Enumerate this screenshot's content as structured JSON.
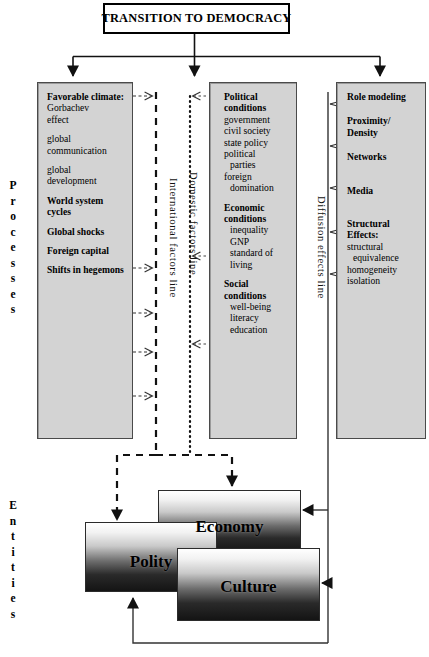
{
  "title": {
    "text": "TRANSITION TO DEMOCRACY"
  },
  "margin_labels": {
    "processes": "Processes",
    "entities": "Entities"
  },
  "axis_labels": {
    "international": "International factors line",
    "domestic": "Domestic factors line",
    "diffusion": "Diffusion effects line"
  },
  "columns": [
    {
      "name": "international-factors",
      "groups": [
        {
          "heading": "Favorable climate:",
          "items": [
            "Gorbachev",
            "effect"
          ]
        },
        {
          "heading": "",
          "items": [
            "global",
            "communication"
          ]
        },
        {
          "heading": "",
          "items": [
            "global",
            "development"
          ]
        },
        {
          "heading": "World system cycles",
          "items": []
        },
        {
          "heading": "Global shocks",
          "items": []
        },
        {
          "heading": "Foreign capital",
          "items": []
        },
        {
          "heading": "Shifts in hegemons",
          "items": []
        }
      ]
    },
    {
      "name": "domestic-factors",
      "groups": [
        {
          "heading": "Political conditions",
          "items": [
            "government",
            "civil society",
            "state policy",
            "political",
            "parties",
            "foreign",
            "domination"
          ]
        },
        {
          "heading": "Economic conditions",
          "items": [
            "inequality",
            "GNP",
            "standard of",
            "living"
          ]
        },
        {
          "heading": "Social conditions",
          "items": [
            "well-being",
            "literacy",
            "education"
          ]
        }
      ]
    },
    {
      "name": "diffusion-effects",
      "groups": [
        {
          "heading": "Role modeling",
          "items": []
        },
        {
          "heading": "Proximity/ Density",
          "items": []
        },
        {
          "heading": "Networks",
          "items": []
        },
        {
          "heading": "Media",
          "items": []
        },
        {
          "heading": "Structural Effects:",
          "items": [
            "structural",
            "equivalence",
            "homogeneity",
            "isolation"
          ]
        }
      ]
    }
  ],
  "entities": [
    {
      "name": "economy",
      "label": "Economy"
    },
    {
      "name": "polity",
      "label": "Polity"
    },
    {
      "name": "culture",
      "label": "Culture"
    }
  ],
  "colors": {
    "box_fill": "#d3d3d3",
    "box_border": "#4a4a4a",
    "line": "#1a1a1a",
    "title_border": "#000000"
  }
}
